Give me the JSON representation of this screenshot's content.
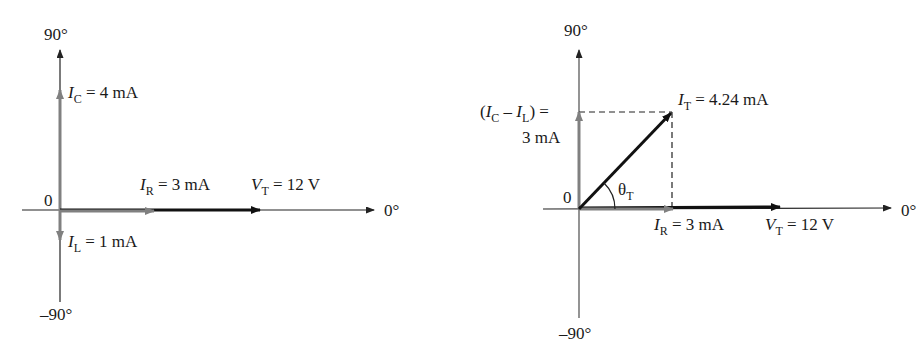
{
  "diagrams": [
    {
      "id": "left",
      "axes": {
        "top_label": "90°",
        "bottom_label": "–90°",
        "right_label": "0°",
        "origin_label": "0"
      },
      "phasors": [
        {
          "name": "I_C",
          "symbol": "I",
          "subscript": "C",
          "value_text": " = 4 mA",
          "color": "#808080"
        },
        {
          "name": "I_L",
          "symbol": "I",
          "subscript": "L",
          "value_text": " = 1 mA",
          "color": "#808080"
        },
        {
          "name": "I_R",
          "symbol": "I",
          "subscript": "R",
          "value_text": " = 3 mA",
          "color": "#808080"
        },
        {
          "name": "V_T",
          "symbol": "V",
          "subscript": "T",
          "value_text": " = 12 V",
          "color": "#111111"
        }
      ]
    },
    {
      "id": "right",
      "axes": {
        "top_label": "90°",
        "bottom_label": "–90°",
        "right_label": "0°",
        "origin_label": "0"
      },
      "reactive_label": {
        "open": "(",
        "sym1": "I",
        "sub1": "C",
        "minus": " – ",
        "sym2": "I",
        "sub2": "L",
        "close": ") =",
        "value": "3 mA"
      },
      "phasors": [
        {
          "name": "I_T",
          "symbol": "I",
          "subscript": "T",
          "value_text": " = 4.24 mA",
          "color": "#111111"
        },
        {
          "name": "I_R",
          "symbol": "I",
          "subscript": "R",
          "value_text": " = 3 mA",
          "color": "#808080"
        },
        {
          "name": "V_T",
          "symbol": "V",
          "subscript": "T",
          "value_text": " = 12 V",
          "color": "#111111"
        }
      ],
      "angle_label": {
        "symbol": "θ",
        "subscript": "T"
      }
    }
  ]
}
